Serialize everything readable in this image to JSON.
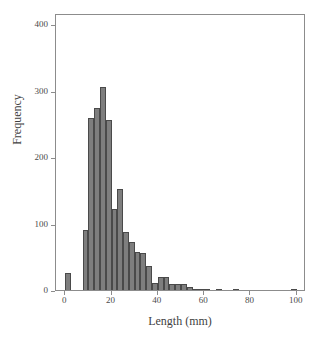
{
  "chart_data": {
    "type": "bar",
    "title": "",
    "subtitle": "",
    "xlabel": "Length (mm)",
    "ylabel": "Frequency",
    "xlim": [
      -4,
      104
    ],
    "ylim": [
      0,
      417
    ],
    "grid": false,
    "legend": null,
    "bin_width": 2.5,
    "bar_color": "#7e7e7e",
    "bar_edge_color": "#4a4a4a",
    "frame_color": "#8c8c8c",
    "x_ticks": [
      {
        "value": 0,
        "label": "0"
      },
      {
        "value": 20,
        "label": "20"
      },
      {
        "value": 40,
        "label": "40"
      },
      {
        "value": 60,
        "label": "60"
      },
      {
        "value": 80,
        "label": "80"
      },
      {
        "value": 100,
        "label": "100"
      }
    ],
    "y_ticks": [
      {
        "value": 0,
        "label": "0"
      },
      {
        "value": 100,
        "label": "100"
      },
      {
        "value": 200,
        "label": "200"
      },
      {
        "value": 300,
        "label": "300"
      },
      {
        "value": 400,
        "label": "400"
      }
    ],
    "categories": [
      0,
      2.5,
      5,
      7.5,
      10,
      12.5,
      15,
      17.5,
      20,
      22.5,
      25,
      27.5,
      30,
      32.5,
      35,
      37.5,
      40,
      42.5,
      45,
      47.5,
      50,
      52.5,
      55,
      57.5,
      60,
      62.5,
      65,
      67.5,
      70,
      72.5,
      75,
      77.5,
      80,
      82.5,
      85,
      87.5,
      90,
      92.5,
      95,
      97.5,
      100
    ],
    "values": [
      26,
      0,
      0,
      91,
      259,
      274,
      305,
      256,
      122,
      152,
      88,
      73,
      57,
      55,
      36,
      11,
      19,
      20,
      9,
      9,
      9,
      4,
      2,
      1,
      1,
      0,
      1,
      0,
      0,
      1,
      0,
      0,
      0,
      0,
      0,
      0,
      0,
      0,
      0,
      1,
      0
    ],
    "bars": [
      {
        "x": 0,
        "value": 26
      },
      {
        "x": 7.5,
        "value": 91
      },
      {
        "x": 10,
        "value": 259
      },
      {
        "x": 12.5,
        "value": 274
      },
      {
        "x": 15,
        "value": 305
      },
      {
        "x": 17.5,
        "value": 256
      },
      {
        "x": 20,
        "value": 122
      },
      {
        "x": 22.5,
        "value": 152
      },
      {
        "x": 25,
        "value": 88
      },
      {
        "x": 27.5,
        "value": 73
      },
      {
        "x": 30,
        "value": 57
      },
      {
        "x": 32.5,
        "value": 55
      },
      {
        "x": 35,
        "value": 36
      },
      {
        "x": 37.5,
        "value": 11
      },
      {
        "x": 40,
        "value": 19
      },
      {
        "x": 42.5,
        "value": 20
      },
      {
        "x": 45,
        "value": 9
      },
      {
        "x": 47.5,
        "value": 9
      },
      {
        "x": 50,
        "value": 9
      },
      {
        "x": 52.5,
        "value": 4
      },
      {
        "x": 55,
        "value": 2
      },
      {
        "x": 57.5,
        "value": 1
      },
      {
        "x": 60,
        "value": 1
      },
      {
        "x": 65,
        "value": 1
      },
      {
        "x": 72.5,
        "value": 1
      },
      {
        "x": 97.5,
        "value": 1
      }
    ]
  }
}
